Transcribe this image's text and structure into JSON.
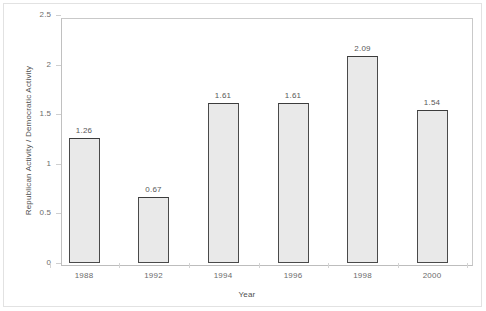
{
  "chart_data": {
    "type": "bar",
    "title": "",
    "xlabel": "Year",
    "ylabel": "Republican Activity / Democratic Activity",
    "categories": [
      "1988",
      "1992",
      "1994",
      "1996",
      "1998",
      "2000"
    ],
    "values": [
      1.26,
      0.67,
      1.61,
      1.61,
      2.09,
      1.54
    ],
    "value_labels": [
      "1.26",
      "0.67",
      "1.61",
      "1.61",
      "2.09",
      "1.54"
    ],
    "ylim": [
      0,
      2.5
    ],
    "y_ticks": [
      0,
      0.5,
      1,
      1.5,
      2,
      2.5
    ],
    "y_tick_labels": [
      "0",
      "0.5",
      "1",
      "1.5",
      "2",
      "2.5"
    ],
    "grid": false,
    "legend": null,
    "bar_fill_color": "#e9e9e9",
    "bar_border_color": "#4a4a4a",
    "axis_color": "#c9c9c9",
    "background_color": "#ffffff"
  }
}
